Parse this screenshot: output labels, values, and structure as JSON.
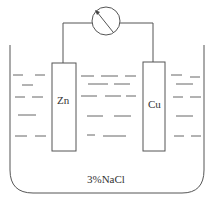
{
  "diagram": {
    "type": "galvanic-cell",
    "meter": {
      "icon": "galvanometer-icon"
    },
    "electrodes": [
      {
        "label": "Zn",
        "side": "left"
      },
      {
        "label": "Cu",
        "side": "right"
      }
    ],
    "electrolyte": {
      "label": "3%NaCl"
    },
    "colors": {
      "stroke": "#555555",
      "background": "#ffffff"
    }
  }
}
